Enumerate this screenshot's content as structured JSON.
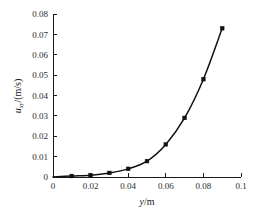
{
  "chart_data": {
    "type": "line",
    "title": "",
    "subtitle": "",
    "xlabel": "y/m",
    "ylabel": "u_xy/(m/s)",
    "ylabel_main": "u",
    "ylabel_sub": "xy",
    "ylabel_rest": "/(m/s)",
    "xlabel_italic": "y",
    "xlabel_rest": "/m",
    "xlim": [
      0,
      0.1
    ],
    "ylim": [
      0,
      0.08
    ],
    "grid": false,
    "legend": null,
    "marker": "square",
    "line_color": "#111111",
    "marker_color": "#111111",
    "x": [
      0,
      0.01,
      0.02,
      0.03,
      0.04,
      0.05,
      0.06,
      0.07,
      0.08,
      0.09
    ],
    "values": [
      0,
      0.0005,
      0.0009,
      0.002,
      0.004,
      0.0078,
      0.016,
      0.029,
      0.048,
      0.073
    ],
    "series": [
      {
        "name": "u_xy",
        "x": [
          0,
          0.01,
          0.02,
          0.03,
          0.04,
          0.05,
          0.06,
          0.07,
          0.08,
          0.09
        ],
        "values": [
          0,
          0.0005,
          0.0009,
          0.002,
          0.004,
          0.0078,
          0.016,
          0.029,
          0.048,
          0.073
        ]
      }
    ],
    "xticks": [
      0,
      0.02,
      0.04,
      0.06,
      0.08,
      0.1
    ],
    "xticklabels": [
      "0",
      "0.02",
      "0.04",
      "0.06",
      "0.08",
      "0.1"
    ],
    "yticks": [
      0,
      0.01,
      0.02,
      0.03,
      0.04,
      0.05,
      0.06,
      0.07,
      0.08
    ],
    "yticklabels": [
      "0",
      "0.01",
      "0.02",
      "0.03",
      "0.04",
      "0.05",
      "0.06",
      "0.07",
      "0.08"
    ]
  }
}
